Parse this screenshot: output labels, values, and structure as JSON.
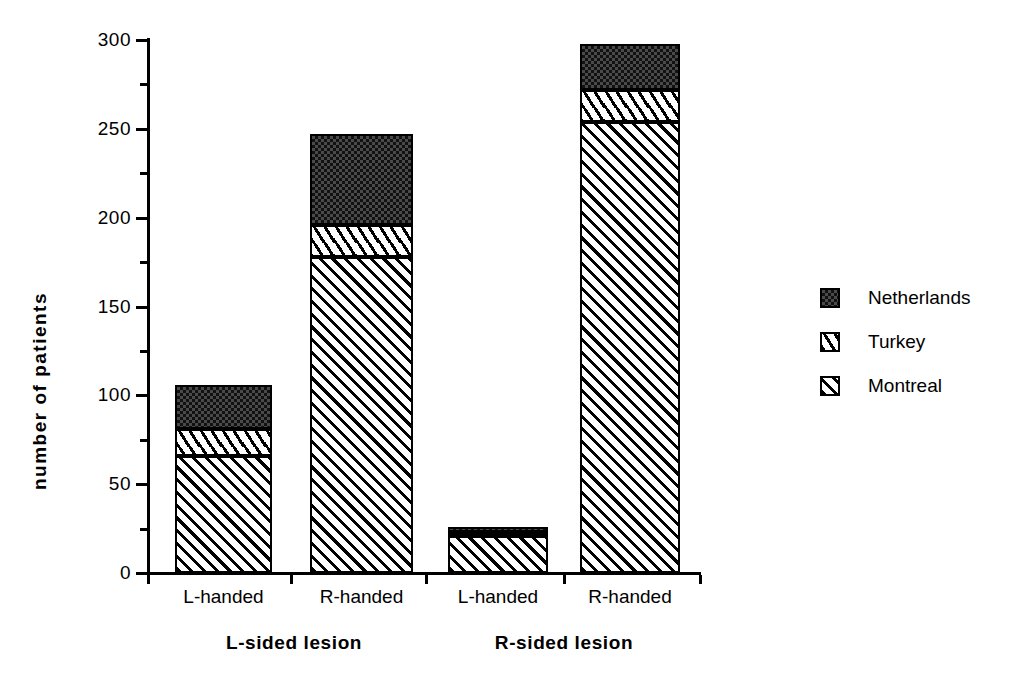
{
  "chart_data": {
    "type": "bar",
    "stacked": true,
    "title": "",
    "xlabel": "",
    "ylabel": "number of patients",
    "ylim": [
      0,
      300
    ],
    "y_major_ticks": [
      0,
      50,
      100,
      150,
      200,
      250,
      300
    ],
    "y_minor_ticks": [
      25,
      75,
      125,
      175,
      225,
      275
    ],
    "grid": false,
    "legend_position": "right",
    "categories": [
      "L-handed",
      "R-handed",
      "L-handed",
      "R-handed"
    ],
    "groups": [
      {
        "label": "L-sided lesion",
        "categories": [
          "L-handed",
          "R-handed"
        ]
      },
      {
        "label": "R-sided lesion",
        "categories": [
          "L-handed",
          "R-handed"
        ]
      }
    ],
    "series": [
      {
        "name": "Montreal",
        "pattern": "diagonal-hatch",
        "values": [
          66,
          178,
          21,
          254
        ]
      },
      {
        "name": "Turkey",
        "pattern": "white-dash",
        "values": [
          15,
          18,
          2,
          18
        ]
      },
      {
        "name": "Netherlands",
        "pattern": "dark-stipple",
        "values": [
          25,
          51,
          3,
          26
        ]
      }
    ],
    "totals": [
      106,
      247,
      26,
      298
    ]
  },
  "axis": {
    "y_title": "number of patients",
    "y_labels": [
      "300",
      "250",
      "200",
      "150",
      "100",
      "50",
      "0"
    ]
  },
  "x_axis": {
    "labels": [
      "L-handed",
      "R-handed",
      "L-handed",
      "R-handed"
    ],
    "group_labels": [
      "L-sided lesion",
      "R-sided lesion"
    ]
  },
  "legend": {
    "items": [
      {
        "label": "Netherlands",
        "pattern": "dark-stipple"
      },
      {
        "label": "Turkey",
        "pattern": "white-dash"
      },
      {
        "label": "Montreal",
        "pattern": "diagonal-hatch"
      }
    ]
  },
  "colors": {
    "axis": "#000000",
    "netherlands": "#4a4a4a",
    "turkey": "#ffffff",
    "montreal": "#ffffff",
    "outline": "#000000"
  }
}
